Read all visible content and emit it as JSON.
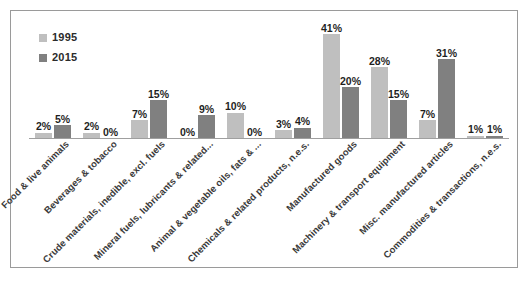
{
  "chart_data": {
    "type": "bar",
    "title": "",
    "subtitle": "",
    "xlabel": "",
    "ylabel": "",
    "ylim": [
      0,
      45
    ],
    "grid": false,
    "legend_position": "top-left",
    "value_suffix": "%",
    "categories": [
      "Food & live animals",
      "Beverages & tobacco",
      "Crude materials, inedible, excl. fuels",
      "Mineral fuels, lubricants & related...",
      "Animal & vegetable oils, fats & ...",
      "Chemicals & related products, n.e.s.",
      "Manufactured goods",
      "Machinery & transport equipment",
      "Misc. manufactured articles",
      "Commodities & transactions, n.e.s."
    ],
    "series": [
      {
        "name": "1995",
        "color": "#bfbfbf",
        "values": [
          2,
          2,
          7,
          0,
          10,
          3,
          41,
          28,
          7,
          1
        ],
        "labels": [
          "2%",
          "2%",
          "7%",
          "0%",
          "10%",
          "3%",
          "41%",
          "28%",
          "7%",
          "1%"
        ]
      },
      {
        "name": "2015",
        "color": "#808080",
        "values": [
          5,
          0,
          15,
          9,
          0,
          4,
          20,
          15,
          31,
          1
        ],
        "labels": [
          "5%",
          "0%",
          "15%",
          "9%",
          "0%",
          "4%",
          "20%",
          "15%",
          "31%",
          "1%"
        ]
      }
    ]
  },
  "legend": {
    "items": [
      {
        "label": "1995",
        "color": "#bfbfbf"
      },
      {
        "label": "2015",
        "color": "#808080"
      }
    ]
  },
  "caption": {
    "text": ""
  },
  "colors": {
    "series_1995": "#bfbfbf",
    "series_2015": "#808080",
    "frame_border": "#9a9a9a",
    "baseline": "#9f9f9f",
    "label_text": "#1f1f1f",
    "category_text": "#3a3a3a"
  }
}
